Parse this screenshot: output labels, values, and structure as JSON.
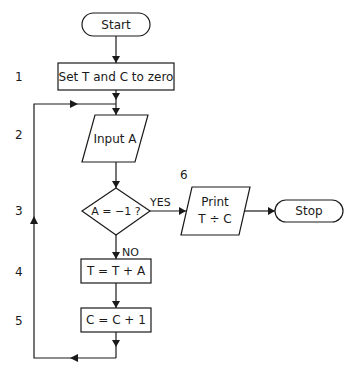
{
  "flowchart": {
    "nodes": {
      "start": {
        "label": "Start",
        "type": "terminal"
      },
      "init": {
        "label": "Set T and C to zero",
        "type": "process",
        "step": "1"
      },
      "input": {
        "label": "Input A",
        "type": "io",
        "step": "2"
      },
      "decision": {
        "label": "A = −1 ?",
        "type": "decision",
        "step": "3"
      },
      "sum": {
        "label": "T = T + A",
        "type": "process",
        "step": "4"
      },
      "count": {
        "label": "C = C + 1",
        "type": "process",
        "step": "5"
      },
      "print": {
        "label_line1": "Print",
        "label_line2": "T ÷ C",
        "type": "io",
        "step": "6"
      },
      "stop": {
        "label": "Stop",
        "type": "terminal"
      }
    },
    "edges": {
      "yes_label": "YES",
      "no_label": "NO"
    },
    "steps": [
      "1",
      "2",
      "3",
      "4",
      "5",
      "6"
    ]
  },
  "colors": {
    "stroke": "#1a1a1a",
    "background": "#ffffff"
  }
}
